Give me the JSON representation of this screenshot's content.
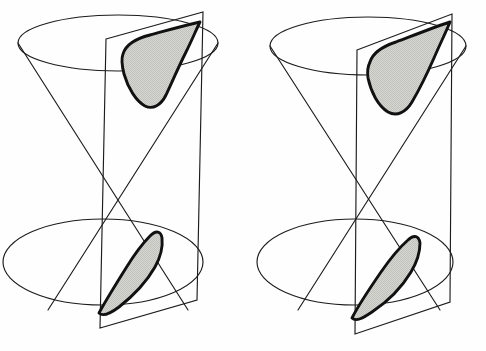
{
  "figure": {
    "title": "Hyperbolic sections of a double cone",
    "background_color": "#fefefe",
    "line_color": "#1c1c1c",
    "section_edge_color": "#111111",
    "section_fill_color": "#d2d2ce",
    "panel_count": 2,
    "panels": [
      {
        "id": "left-panel",
        "name": "left-double-cone",
        "label": "",
        "plane_tilt": "steeper-narrow",
        "apex": {
          "x": 118,
          "y": 174
        },
        "top_ellipse": {
          "cx": 118,
          "cy": 43,
          "rx": 100,
          "ry": 28
        },
        "bottom_ellipse": {
          "cx": 103,
          "cy": 262,
          "rx": 100,
          "ry": 43
        },
        "upper_section": {
          "name": "upper-hyperbola-branch",
          "shape": "hyperbola-branch",
          "fill": "#d2d2ce"
        },
        "lower_section": {
          "name": "lower-hyperbola-branch",
          "shape": "hyperbola-branch",
          "fill": "#d2d2ce"
        }
      },
      {
        "id": "right-panel",
        "name": "right-double-cone",
        "label": "",
        "plane_tilt": "wider-offset",
        "apex": {
          "x": 368,
          "y": 174
        },
        "top_ellipse": {
          "cx": 368,
          "cy": 46,
          "rx": 98,
          "ry": 29
        },
        "bottom_ellipse": {
          "cx": 355,
          "cy": 262,
          "rx": 98,
          "ry": 43
        },
        "upper_section": {
          "name": "upper-hyperbola-branch",
          "shape": "hyperbola-branch",
          "fill": "#d2d2ce"
        },
        "lower_section": {
          "name": "lower-hyperbola-branch",
          "shape": "hyperbola-branch",
          "fill": "#d2d2ce"
        }
      }
    ]
  },
  "geometry": {
    "left": {
      "top_ellipse_path": "M 18,43 A 100,28 0 0 1 218,43 A 100,28 0 0 1 18,43 Z",
      "bottom_ellipse_path": "M 3,262 A 100,43 0 0 1 203,262 A 100,43 0 0 1 3,262 Z",
      "generator_a": "M 18,43 L 188,310",
      "generator_b": "M 218,43 L 48,310",
      "plane_path": "M 106,39 L 203,12 L 197,300 L 100,328 Z",
      "plane_back_edge": "M 106,39 L 203,12",
      "upper_section_path": "M 123,54 C 126,44 138,38 150,35 C 165,31 182,26 200,22 C 196,30 192,40 186,52 C 179,66 172,82 166,95 C 161,105 153,110 145,106 C 136,101 128,88 124,74 C 122,66 121,59 123,54 Z",
      "lower_section_path": "M 99,313 C 106,300 116,284 126,268 C 134,255 143,243 150,236 C 156,230 161,231 162,238 C 163,247 160,258 155,267 C 147,281 133,296 119,307 C 111,313 103,317 99,313 Z"
    },
    "right": {
      "top_ellipse_path": "M 270,46 A 98,29 0 0 1 466,46 A 98,29 0 0 1 270,46 Z",
      "bottom_ellipse_path": "M 257,262 A 98,43 0 0 1 453,262 A 98,43 0 0 1 257,262 Z",
      "generator_a": "M 270,46 L 440,310",
      "generator_b": "M 466,46 L 298,310",
      "plane_path": "M 357,50 L 452,14 L 450,302 L 355,334 Z",
      "plane_back_edge": "M 357,50 L 452,14",
      "upper_section_path": "M 370,62 C 373,52 384,46 396,42 C 412,36 432,28 450,22 C 446,32 440,44 434,58 C 427,74 419,90 412,102 C 406,112 397,117 388,112 C 378,106 371,92 368,78 C 367,71 368,66 370,62 Z",
      "lower_section_path": "M 352,318 C 359,304 370,288 381,272 C 390,259 400,247 408,240 C 414,234 419,236 420,243 C 420,252 417,262 411,272 C 402,287 387,302 372,312 C 363,318 356,322 352,318 Z"
    }
  }
}
